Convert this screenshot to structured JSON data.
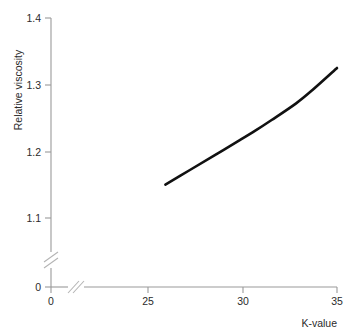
{
  "chart_data": {
    "type": "line",
    "title": "",
    "subtitle": "",
    "xlabel": "K-value",
    "ylabel": "Relative viscosity",
    "xlim": [
      0,
      35
    ],
    "ylim": [
      0,
      1.4
    ],
    "x_ticks": [
      "0",
      "25",
      "30",
      "35"
    ],
    "y_ticks": [
      "0",
      "1.1",
      "1.2",
      "1.3",
      "1.4"
    ],
    "grid": false,
    "legend": null,
    "axis_breaks": {
      "x_axis": true,
      "y_axis": true,
      "note": "double-slash break marks on both axes near origin"
    },
    "series": [
      {
        "name": "Relative viscosity vs K-value",
        "x": [
          14,
          17,
          20,
          23,
          25,
          27,
          30,
          32,
          35
        ],
        "values": [
          1.15,
          1.172,
          1.194,
          1.216,
          1.231,
          1.247,
          1.272,
          1.292,
          1.325
        ],
        "color": "#111111",
        "line_width": 2.6,
        "markers": false
      }
    ],
    "x_tick_values": [
      0,
      25,
      30,
      35
    ],
    "y_tick_values": [
      0,
      1.1,
      1.2,
      1.3,
      1.4
    ]
  },
  "axes": {
    "y_axis_label": "Relative viscosity",
    "x_axis_label": "K-value",
    "y_tick_labels": [
      {
        "text": "1.4"
      },
      {
        "text": "1.3"
      },
      {
        "text": "1.2"
      },
      {
        "text": "1.1"
      },
      {
        "text": "0"
      }
    ],
    "x_tick_labels": [
      {
        "text": "0"
      },
      {
        "text": "25"
      },
      {
        "text": "30"
      },
      {
        "text": "35"
      }
    ]
  },
  "colors": {
    "background": "#ffffff",
    "axis": "#9a9a9a",
    "curve": "#111111",
    "text": "#2b2b2b"
  }
}
